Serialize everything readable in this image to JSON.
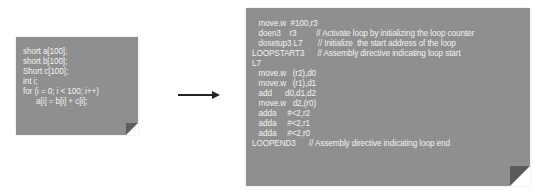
{
  "diagram": {
    "source_code": {
      "lines": [
        "short a[100];",
        "short b[100];",
        "Short c[100];",
        "int i;",
        "for (i = 0; i < 100; i++)",
        "      a[i] = b[i] + c[i];"
      ]
    },
    "arrow": {
      "direction": "right"
    },
    "assembly_code": {
      "lines": [
        "   move.w  #100,r3",
        "   doen3    r3         // Activate loop by initializing the loop counter",
        "   dosetup3 L7       // Initialize  the start address of the loop",
        "LOOPSTART3      // Assembly directive indicating loop start",
        "L7",
        "   move.w   (r2),d0",
        "   move.w   (r1),d1",
        "   add      d0,d1,d2",
        "   move.w   d2,(r0)",
        "   adda     #<2,r2",
        "   adda     #<2,r1",
        "   adda     #<2,r0",
        "LOOPEND3      // Assembly directive indicating loop end"
      ]
    },
    "colors": {
      "note_background": "#8f8f8f",
      "note_text": "#f2f2f2",
      "arrow": "#222222"
    }
  }
}
